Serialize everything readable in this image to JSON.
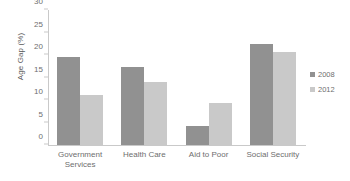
{
  "chart_data": {
    "type": "bar",
    "title": "",
    "xlabel": "",
    "ylabel": "Age Gap (%)",
    "ylim": [
      0,
      30
    ],
    "yticks": [
      0,
      5,
      10,
      15,
      20,
      25,
      30
    ],
    "grid": false,
    "legend_position": "right",
    "categories": [
      "Government\nServices",
      "Health Care",
      "Aid to Poor",
      "Social Security"
    ],
    "series": [
      {
        "name": "2008",
        "color": "#919191",
        "values": [
          19.5,
          17.3,
          4.2,
          22.5
        ]
      },
      {
        "name": "2012",
        "color": "#c9c9c9",
        "values": [
          11.1,
          14.0,
          9.3,
          20.7
        ]
      }
    ]
  },
  "legend": {
    "items": [
      {
        "label": "2008",
        "color": "#919191"
      },
      {
        "label": "2012",
        "color": "#c9c9c9"
      }
    ]
  }
}
